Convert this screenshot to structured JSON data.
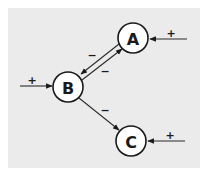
{
  "diagram": {
    "type": "signed-directed-graph",
    "colors": {
      "background": "#ebebeb",
      "node_fill": "#ffffff",
      "stroke": "#1a1a1a"
    },
    "nodes": [
      {
        "id": "A",
        "label": "A",
        "cx": 133,
        "cy": 38,
        "r": 15
      },
      {
        "id": "B",
        "label": "B",
        "cx": 68,
        "cy": 87,
        "r": 15
      },
      {
        "id": "C",
        "label": "C",
        "cx": 131,
        "cy": 141,
        "r": 15
      }
    ],
    "edges": [
      {
        "from": "A",
        "to": "B",
        "sign": "−"
      },
      {
        "from": "B",
        "to": "A",
        "sign": "−"
      },
      {
        "from": "B",
        "to": "C",
        "sign": "−"
      },
      {
        "from": "external",
        "to": "A",
        "sign": "+"
      },
      {
        "from": "external",
        "to": "B",
        "sign": "+"
      },
      {
        "from": "external",
        "to": "C",
        "sign": "+"
      }
    ],
    "labels": {
      "node_a": "A",
      "node_b": "B",
      "node_c": "C",
      "sign_a_to_b": "−",
      "sign_b_to_a": "−",
      "sign_b_to_c": "−",
      "sign_input_a": "+",
      "sign_input_b": "+",
      "sign_input_c": "+"
    }
  }
}
